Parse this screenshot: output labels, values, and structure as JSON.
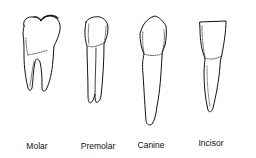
{
  "diagram": {
    "type": "tooth-types-illustration",
    "teeth": [
      {
        "name": "Molar",
        "label": "Molar"
      },
      {
        "name": "Premolar",
        "label": "Premolar"
      },
      {
        "name": "Canine",
        "label": "Canine"
      },
      {
        "name": "Incisor",
        "label": "Incisor"
      }
    ],
    "colors": {
      "line": "#111111",
      "background": "#ffffff"
    }
  }
}
